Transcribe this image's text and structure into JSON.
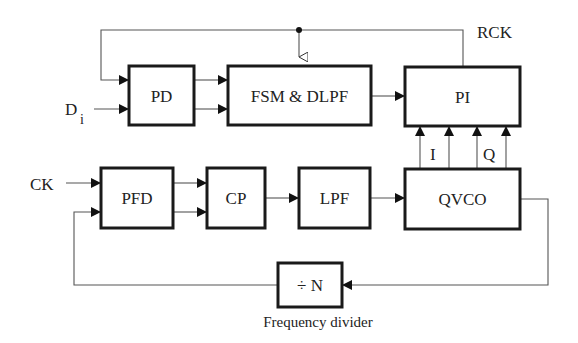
{
  "diagram": {
    "type": "block-diagram",
    "blocks": {
      "pd": "PD",
      "fsm": "FSM & DLPF",
      "pi": "PI",
      "pfd": "PFD",
      "cp": "CP",
      "lpf": "LPF",
      "qvco": "QVCO",
      "divider": "÷ N"
    },
    "signals": {
      "data_in": "D",
      "data_in_sub": "i",
      "clock_in": "CK",
      "recovered_clock": "RCK",
      "in_phase": "I",
      "quadrature": "Q"
    },
    "captions": {
      "divider_caption": "Frequency divider"
    },
    "colors": {
      "box_stroke": "#1a1a1a",
      "wire": "#555555",
      "background": "#ffffff"
    }
  }
}
